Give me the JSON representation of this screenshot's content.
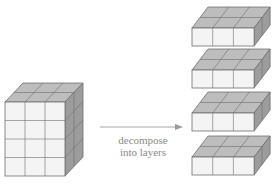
{
  "diagram": {
    "source_block": {
      "label": "source-block",
      "columns": 3,
      "depth_rows": 2,
      "layers": 4
    },
    "arrow": {
      "caption_line1": "decompose",
      "caption_line2": "into layers"
    },
    "layers": [
      {
        "label": "layer-1",
        "columns": 3,
        "depth_rows": 2,
        "height": 1
      },
      {
        "label": "layer-2",
        "columns": 3,
        "depth_rows": 2,
        "height": 1
      },
      {
        "label": "layer-3",
        "columns": 3,
        "depth_rows": 2,
        "height": 1
      },
      {
        "label": "layer-4",
        "columns": 3,
        "depth_rows": 2,
        "height": 1
      }
    ],
    "colors": {
      "front_face": "#f4f4f4",
      "top_face": "#bdbdbd",
      "side_face": "#9c9c9c",
      "edge": "#6e6e6e",
      "arrow": "#9a9a9a",
      "caption": "#8a8a8a"
    }
  }
}
